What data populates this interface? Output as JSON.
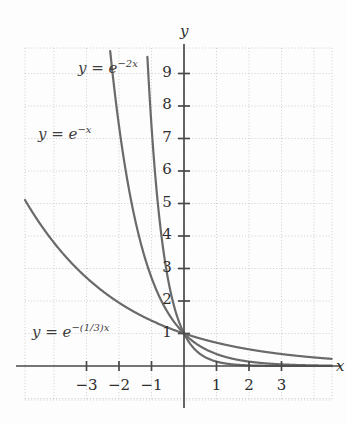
{
  "figure": {
    "background_color": "#fdfdfd",
    "grid_color": "#c9c9c9",
    "axis_color": "#4a4a4a",
    "curve_color": "#6a6a6a",
    "text_color": "#3a3a3a"
  },
  "axes": {
    "x_axis_label": "x",
    "y_axis_label": "y",
    "x_ticks": [
      "-3",
      "-2",
      "-1",
      "1",
      "2",
      "3"
    ],
    "y_ticks": [
      "1",
      "2",
      "3",
      "4",
      "5",
      "6",
      "7",
      "8",
      "9"
    ]
  },
  "curve_labels": {
    "c1_base": "y = e",
    "c1_exp": "-2x",
    "c2_base": "y = e",
    "c2_exp": "-x",
    "c3_base": "y = e",
    "c3_exp": "-(1/3)x"
  },
  "chart_data": {
    "type": "line",
    "title": "",
    "xlabel": "x",
    "ylabel": "y",
    "xlim": [
      -3.6,
      4.5
    ],
    "ylim": [
      -0.55,
      9.9
    ],
    "grid": true,
    "grid_spacing": 1,
    "legend": "inline-curve-labels",
    "x": [
      -3.6,
      -3.2,
      -2.8,
      -2.4,
      -2.0,
      -1.6,
      -1.2,
      -0.8,
      -0.4,
      0,
      0.4,
      0.8,
      1.2,
      1.6,
      2.0,
      2.4,
      2.8,
      3.2,
      3.6,
      4.0,
      4.5
    ],
    "series": [
      {
        "name": "y = e^(-2x)",
        "formula": "exp(-2x)",
        "label_x": -1.95,
        "label_y": 9.55,
        "values": [
          null,
          null,
          null,
          null,
          null,
          null,
          null,
          null,
          2.23,
          1.0,
          0.449,
          0.202,
          0.091,
          0.041,
          0.018,
          0.008,
          0.004,
          0.002,
          0.001,
          0.0003,
          0.0001
        ]
      },
      {
        "name": "y = e^(-x)",
        "formula": "exp(-x)",
        "label_x": -3.05,
        "label_y": 7.35,
        "values": [
          null,
          null,
          null,
          null,
          null,
          null,
          3.32,
          2.23,
          1.49,
          1.0,
          0.67,
          0.449,
          0.301,
          0.202,
          0.135,
          0.091,
          0.061,
          0.041,
          0.027,
          0.018,
          0.011
        ]
      },
      {
        "name": "y = e^(-(1/3)x)",
        "formula": "exp(-x/3)",
        "label_x": -3.15,
        "label_y": 1.1,
        "values": [
          3.32,
          2.9,
          2.54,
          2.23,
          1.95,
          1.7,
          1.49,
          1.31,
          1.14,
          1.0,
          0.875,
          0.766,
          0.67,
          0.587,
          0.513,
          0.449,
          0.393,
          0.344,
          0.301,
          0.264,
          0.223
        ]
      }
    ]
  }
}
